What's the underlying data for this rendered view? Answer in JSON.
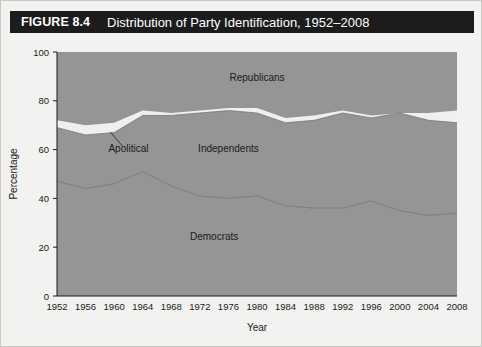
{
  "figure": {
    "number": "FIGURE 8.4",
    "title": "Distribution of Party Identification, 1952–2008"
  },
  "colors": {
    "title_bar": "#1c1c1c",
    "title_text": "#ffffff",
    "page_background": "#f2f2f0",
    "band_fill": "#959595",
    "apolitical_fill": "#efefed",
    "boundary_line": "#6f6f6f",
    "axis": "#1a1a1a"
  },
  "chart_data": {
    "type": "area",
    "title": "Distribution of Party Identification, 1952–2008",
    "subtitle": "",
    "xlabel": "Year",
    "ylabel": "Percentage",
    "stacked": true,
    "grid": false,
    "legend_position": "inline-annotations",
    "xlim": [
      1952,
      2008
    ],
    "ylim": [
      0,
      100
    ],
    "ytick_labels": [
      "0",
      "20",
      "40",
      "60",
      "80",
      "100"
    ],
    "ytick_values": [
      0,
      20,
      40,
      60,
      80,
      100
    ],
    "xtick_labels": [
      "1952",
      "1956",
      "1960",
      "1964",
      "1968",
      "1972",
      "1976",
      "1980",
      "1984",
      "1988",
      "1992",
      "1996",
      "2000",
      "2004",
      "2008"
    ],
    "x": [
      1952,
      1956,
      1960,
      1964,
      1968,
      1972,
      1976,
      1980,
      1984,
      1988,
      1992,
      1996,
      2000,
      2004,
      2008
    ],
    "series": [
      {
        "name": "Democrats",
        "order": 1,
        "values": [
          47,
          44,
          46,
          51,
          45,
          41,
          40,
          41,
          37,
          36,
          36,
          39,
          35,
          33,
          34
        ]
      },
      {
        "name": "Independents",
        "order": 2,
        "values": [
          22,
          22,
          21,
          23,
          29,
          34,
          36,
          34,
          34,
          36,
          39,
          34,
          40,
          39,
          37
        ]
      },
      {
        "name": "Apolitical",
        "order": 3,
        "values": [
          3,
          4,
          4,
          2,
          1,
          1,
          1,
          2,
          2,
          2,
          1,
          1,
          0,
          3,
          5
        ]
      },
      {
        "name": "Republicans",
        "order": 4,
        "values": [
          28,
          30,
          29,
          24,
          25,
          24,
          23,
          23,
          27,
          26,
          24,
          26,
          25,
          25,
          24
        ]
      }
    ],
    "cumulative_upper_boundaries": {
      "democrats_top": [
        47,
        44,
        46,
        51,
        45,
        41,
        40,
        41,
        37,
        36,
        36,
        39,
        35,
        33,
        34
      ],
      "independents_top": [
        69,
        66,
        67,
        74,
        74,
        75,
        76,
        75,
        71,
        72,
        75,
        73,
        75,
        72,
        71
      ],
      "apolitical_top": [
        72,
        70,
        71,
        76,
        75,
        76,
        77,
        77,
        73,
        74,
        76,
        74,
        75,
        75,
        76
      ],
      "republicans_top": [
        100,
        100,
        100,
        100,
        100,
        100,
        100,
        100,
        100,
        100,
        100,
        100,
        100,
        100,
        100
      ]
    },
    "annotations": [
      {
        "text": "Republicans",
        "x": 1980,
        "y": 88
      },
      {
        "text": "Independents",
        "x": 1976,
        "y": 59
      },
      {
        "text": "Apolitical",
        "x": 1962,
        "y": 59,
        "leader_line": true
      },
      {
        "text": "Democrats",
        "x": 1974,
        "y": 23
      }
    ]
  }
}
